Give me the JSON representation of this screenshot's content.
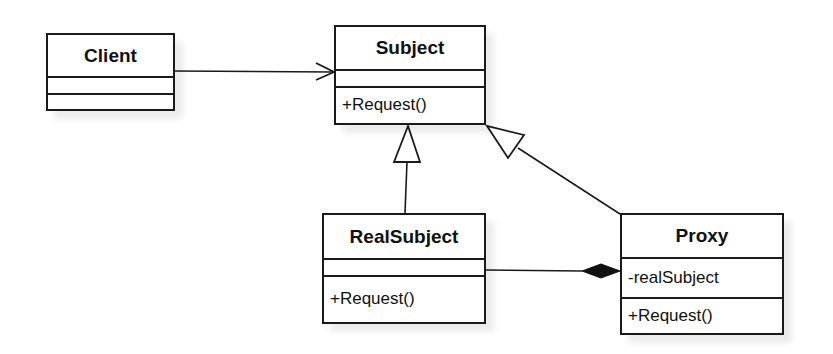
{
  "diagram": {
    "type": "UML class diagram",
    "classes": {
      "client": {
        "name": "Client",
        "attributes": [],
        "operations": []
      },
      "subject": {
        "name": "Subject",
        "attributes": [],
        "operations": [
          "+Request()"
        ]
      },
      "real_subject": {
        "name": "RealSubject",
        "attributes": [],
        "operations": [
          "+Request()"
        ]
      },
      "proxy": {
        "name": "Proxy",
        "attributes": [
          "-realSubject"
        ],
        "operations": [
          "+Request()"
        ]
      }
    },
    "relationships": [
      {
        "from": "Client",
        "to": "Subject",
        "kind": "association",
        "arrow": "open"
      },
      {
        "from": "RealSubject",
        "to": "Subject",
        "kind": "generalization",
        "arrow": "hollow-triangle"
      },
      {
        "from": "Proxy",
        "to": "Subject",
        "kind": "generalization",
        "arrow": "hollow-triangle"
      },
      {
        "from": "RealSubject",
        "to": "Proxy",
        "kind": "composition",
        "arrow": "filled-diamond"
      }
    ]
  },
  "colors": {
    "line": "#1a1a1a",
    "background": "#ffffff"
  }
}
